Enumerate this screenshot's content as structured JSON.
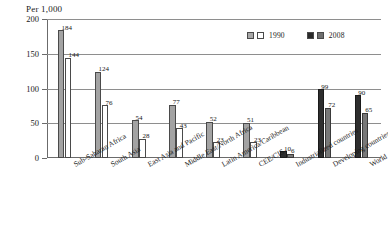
{
  "chart_data": {
    "type": "bar",
    "title": "",
    "ylabel": "Per 1,000",
    "xlabel": "",
    "ylim": [
      0,
      200
    ],
    "yticks": [
      0,
      50,
      100,
      150,
      200
    ],
    "ytick_labels": [
      "0",
      "50",
      "100",
      "150",
      "200"
    ],
    "grid": "horizontal",
    "legend_position": "top-right",
    "categories": [
      "Sub-Saharan Africa",
      "South Asia",
      "East Asia and Pacific",
      "Middle East/North Africa",
      "Latin America/Caribbean",
      "CEE/CIS",
      "Industrialized countries",
      "Developing countries",
      "World"
    ],
    "series": [
      {
        "name": "1990",
        "values": [
          184,
          124,
          54,
          77,
          52,
          51,
          10,
          99,
          90
        ]
      },
      {
        "name": "2008",
        "values": [
          144,
          76,
          28,
          43,
          23,
          23,
          6,
          72,
          65
        ]
      }
    ],
    "legend": [
      {
        "label": "1990",
        "swatch_a": "#a8a8a8",
        "swatch_b": "#ffffff"
      },
      {
        "label": "2008",
        "swatch_a": "#2a2a2a",
        "swatch_b": "#6f6f6f"
      }
    ],
    "group_styles": [
      "light",
      "light",
      "light",
      "light",
      "light",
      "light",
      "dark",
      "dark",
      "dark"
    ]
  }
}
